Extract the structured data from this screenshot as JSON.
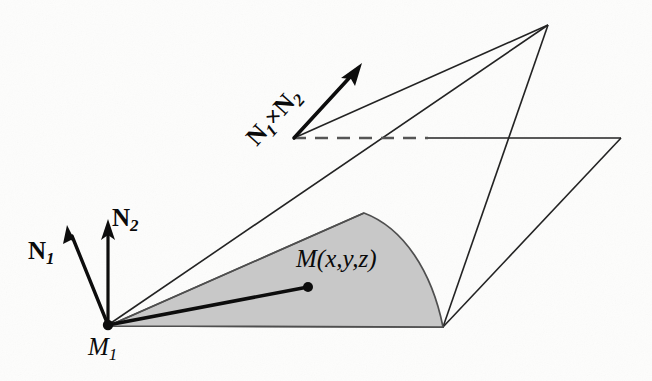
{
  "figure": {
    "background_color": "#fdfdfc",
    "stroke_color": "#1a1a1a",
    "shaded_fill": "#c9c9c9",
    "shaded_stroke": "#4a4a4a",
    "labels": {
      "n1": {
        "base": "N",
        "subscript": "1",
        "full": "N1"
      },
      "n2": {
        "base": "N",
        "subscript": "2",
        "full": "N2"
      },
      "n_cross": {
        "base_a": "N",
        "sub_a": "1",
        "operator": "×",
        "base_b": "N",
        "sub_b": "2",
        "full": "N1×N2"
      },
      "m1": {
        "base": "M",
        "subscript": "1",
        "full": "M1"
      },
      "m_point": {
        "base": "M",
        "args": "(x,y,z)",
        "full": "M(x,y,z)"
      }
    },
    "points": {
      "origin_M1": {
        "x": 108,
        "y": 325,
        "name": "M1"
      },
      "point_M": {
        "x": 308,
        "y": 287,
        "name": "M(x,y,z)"
      },
      "cross_base": {
        "x": 294,
        "y": 138,
        "name": "N1xN2 base"
      },
      "cross_tip": {
        "x": 361,
        "y": 64,
        "name": "N1xN2 tip"
      },
      "n1_tip": {
        "x": 67,
        "y": 227,
        "name": "N1 tip"
      },
      "n2_tip": {
        "x": 108,
        "y": 221,
        "name": "N2 tip"
      },
      "apex": {
        "x": 548,
        "y": 25,
        "name": "upper plane apex"
      },
      "plane_right": {
        "x": 620,
        "y": 138,
        "name": "plane right corner"
      },
      "sector_top": {
        "x": 364,
        "y": 213,
        "name": "sector top corner"
      },
      "sector_bottom": {
        "x": 443,
        "y": 327,
        "name": "sector bottom corner"
      },
      "dash_end": {
        "x": 428,
        "y": 138,
        "name": "dashed segment end"
      }
    }
  }
}
